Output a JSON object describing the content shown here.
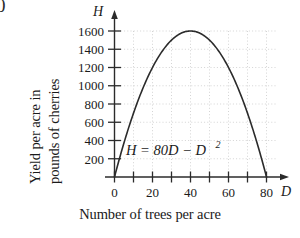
{
  "corner_artifact": "0",
  "axes": {
    "y_title_lines": [
      "Yield per acre in",
      "pounds of cherries"
    ],
    "x_title": "Number of trees per acre",
    "x_axis_name": "D",
    "y_axis_name": "H"
  },
  "annotation": {
    "equation_main": "H  =  80D  −  D",
    "equation_exponent": "2"
  },
  "colors": {
    "background": "#ffffff",
    "curve": "#2b2b2b",
    "axis": "#2b2b2b",
    "gridline": "#cfcfcf",
    "text": "#1a1a1a"
  },
  "chart_data": {
    "type": "line",
    "title": "",
    "subtitle": "",
    "xlabel": "Number of trees per acre",
    "ylabel": "Yield per acre in pounds of cherries",
    "equation": "H = 80D - D^2",
    "xlim": [
      0,
      85
    ],
    "ylim": [
      0,
      1720
    ],
    "grid": true,
    "legend": null,
    "x_ticks_major": [
      0,
      20,
      40,
      60,
      80
    ],
    "x_tick_labels": [
      "0",
      "20",
      "40",
      "60",
      "80"
    ],
    "x_ticks_minor": [
      10,
      30,
      50,
      70
    ],
    "y_ticks_major": [
      200,
      400,
      600,
      800,
      1000,
      1200,
      1400,
      1600
    ],
    "y_tick_labels": [
      "200",
      "400",
      "600",
      "800",
      "1000",
      "1200",
      "1400",
      "1600"
    ],
    "gridlines_x": [
      10,
      20,
      30,
      40,
      50,
      60,
      70,
      80
    ],
    "gridlines_y": [
      200,
      400,
      600,
      800,
      1000,
      1200,
      1400,
      1600
    ],
    "vertex": {
      "x": 40,
      "y": 1600
    },
    "roots": [
      0,
      80
    ],
    "x": [
      0,
      5,
      10,
      15,
      20,
      25,
      30,
      35,
      40,
      45,
      50,
      55,
      60,
      65,
      70,
      75,
      80
    ],
    "y": [
      0,
      375,
      700,
      975,
      1200,
      1375,
      1500,
      1575,
      1600,
      1575,
      1500,
      1375,
      1200,
      975,
      700,
      375,
      0
    ],
    "series": [
      {
        "name": "H = 80D - D^2",
        "x": [
          0,
          5,
          10,
          15,
          20,
          25,
          30,
          35,
          40,
          45,
          50,
          55,
          60,
          65,
          70,
          75,
          80
        ],
        "values": [
          0,
          375,
          700,
          975,
          1200,
          1375,
          1500,
          1575,
          1600,
          1575,
          1500,
          1375,
          1200,
          975,
          700,
          375,
          0
        ]
      }
    ]
  }
}
